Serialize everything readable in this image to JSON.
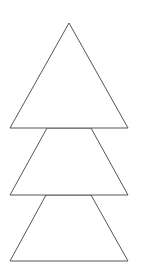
{
  "diagram": {
    "type": "stacked-tree-shapes",
    "canvas": {
      "width": 142,
      "height": 276,
      "background": "#ffffff"
    },
    "stroke_color": "#555555",
    "fill_color": "#ffffff",
    "shapes": [
      {
        "name": "top-triangle",
        "kind": "triangle",
        "points": "69,23 10,128 128,128"
      },
      {
        "name": "middle-trapezoid",
        "kind": "trapezoid",
        "points": "47,128 91,128 128,195 10,195"
      },
      {
        "name": "bottom-trapezoid",
        "kind": "trapezoid",
        "points": "46,195 91,195 128,261 10,261"
      }
    ]
  }
}
